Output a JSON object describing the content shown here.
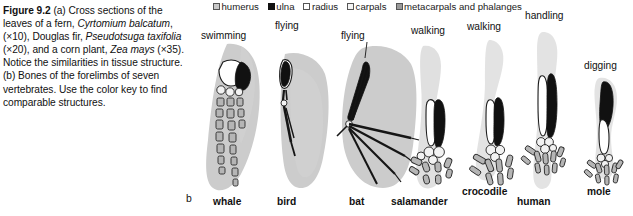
{
  "figure": {
    "number": "Figure 9.2",
    "caption_a": "(a) Cross sections of the leaves of a fern, ",
    "species_1": "Cyrtomium balcatum",
    "caption_a2": ", (×10), Douglas fir, ",
    "species_2": "Pseudotsuga taxifolia",
    "caption_a3": " (×20), and a corn plant, ",
    "species_3": "Zea mays",
    "caption_a4": " (×35). Notice the similarities in tissue structure. (b) Bones of the forelimbs of seven vertebrates. Use the color key to find comparable structures.",
    "panel_label_b": "b"
  },
  "legend": {
    "items": [
      {
        "label": "humerus",
        "color": "#c9c9c9"
      },
      {
        "label": "ulna",
        "color": "#111111"
      },
      {
        "label": "radius",
        "color": "#ffffff"
      },
      {
        "label": "carpals",
        "color": "#f4f4f4"
      },
      {
        "label": "metacarpals and phalanges",
        "color": "#9a9a9a"
      }
    ]
  },
  "specimens": [
    {
      "name": "whale",
      "function": "swimming"
    },
    {
      "name": "bird",
      "function": "flying"
    },
    {
      "name": "bat",
      "function": "flying"
    },
    {
      "name": "salamander",
      "function": "walking"
    },
    {
      "name": "crocodile",
      "function": "walking"
    },
    {
      "name": "human",
      "function": "handling"
    },
    {
      "name": "mole",
      "function": "digging"
    }
  ]
}
